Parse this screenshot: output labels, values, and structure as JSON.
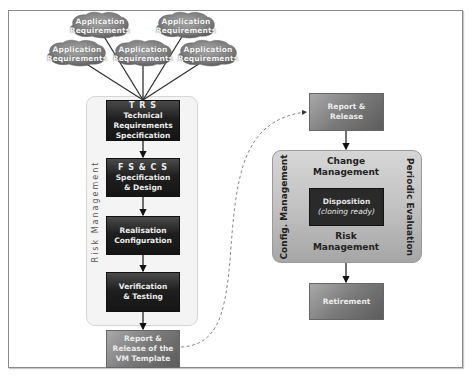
{
  "diagram": {
    "app_requirements": [
      {
        "line1": "Application",
        "line2": "Requirements",
        "cx": 100,
        "cy": 25
      },
      {
        "line1": "Application",
        "line2": "Requirements",
        "cx": 186,
        "cy": 25
      },
      {
        "line1": "Application",
        "line2": "Requirements",
        "cx": 77,
        "cy": 53
      },
      {
        "line1": "Application",
        "line2": "Requirements",
        "cx": 143,
        "cy": 53
      },
      {
        "line1": "Application",
        "line2": "Requirements",
        "cx": 208,
        "cy": 53
      }
    ],
    "risk_management_label": "Risk Management",
    "left_flow": [
      {
        "title": "T R S",
        "lines": [
          "Technical",
          "Requirements",
          "Specification"
        ]
      },
      {
        "title": "F S & C S",
        "lines": [
          "Specification",
          "& Design"
        ]
      },
      {
        "lines": [
          "Realisation",
          "Configuration"
        ]
      },
      {
        "lines": [
          "Verification",
          "& Testing"
        ]
      }
    ],
    "report_vm": {
      "lines": [
        "Report &",
        "Release of the",
        "VM Template"
      ]
    },
    "report_release": {
      "lines": [
        "Report &",
        "Release"
      ]
    },
    "operation_box": {
      "top": [
        "Change",
        "Management"
      ],
      "bottom": [
        "Risk",
        "Management"
      ],
      "left": "Config. Management",
      "right": "Periodic Evaluation",
      "center": {
        "title": "Disposition",
        "subtitle": "(cloning ready)"
      }
    },
    "retirement": {
      "label": "Retirement"
    },
    "colors": {
      "dark_box": "#1f1f1f",
      "mid_box": "#7a7a7a",
      "operation_box": "#c2c2c2",
      "container": "#f4f4f4",
      "cloud": "#8c8c8c"
    }
  }
}
